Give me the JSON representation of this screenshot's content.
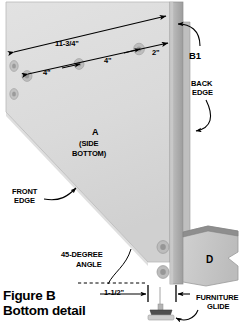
{
  "figure": {
    "caption_line1": "Figure B",
    "caption_line2": "Bottom detail"
  },
  "colors": {
    "panel_face": "#dcdcdc",
    "panel_face_shade": "#d2d2d2",
    "back_edge_strip": "#b6b6b6",
    "back_edge_dark": "#9a9a9a",
    "block_d_face": "#c6c6c6",
    "block_d_top": "#8e8e8e",
    "glide_dark": "#5a5a5a",
    "glide_light": "#c9c9c9",
    "hole_ring": "#b0b0b0",
    "hole_center": "#8c8c8c",
    "line": "#000000",
    "background": "#ffffff"
  },
  "dimensions": {
    "overall_length": "11-3/4\"",
    "spacing_1": "4\"",
    "spacing_2": "4\"",
    "spacing_3": "2\"",
    "offset_from_edge": "1-1/2\""
  },
  "labels": {
    "back_panel": "B1",
    "back_edge_line1": "BACK",
    "back_edge_line2": "EDGE",
    "front_edge_line1": "FRONT",
    "front_edge_line2": "EDGE",
    "angle_line1": "45-DEGREE",
    "angle_line2": "ANGLE",
    "furniture_glide_line1": "FURNITURE",
    "furniture_glide_line2": "GLIDE",
    "part_a": "A",
    "part_a_sub_line1": "(SIDE",
    "part_a_sub_line2": "BOTTOM)",
    "part_d": "D"
  },
  "icons": {
    "screw_hole": "screw-hole-icon",
    "arrow_dimension": "dimension-arrow-icon",
    "arrow_leader": "leader-arrow-icon",
    "dashed_extension": "dashed-extension-line-icon"
  }
}
